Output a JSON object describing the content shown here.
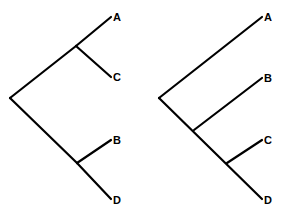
{
  "diagram": {
    "type": "cladogram-comparison",
    "line_color": "#000000",
    "background": "#ffffff",
    "trees": [
      {
        "name": "left-tree",
        "topology": "((A,C),(B,D))",
        "root": [
          10,
          98
        ],
        "branches": [
          {
            "from": [
              10,
              98
            ],
            "to": [
              76,
              46
            ]
          },
          {
            "from": [
              76,
              46
            ],
            "to": [
              111,
              17
            ]
          },
          {
            "from": [
              76,
              46
            ],
            "to": [
              111,
              77
            ]
          },
          {
            "from": [
              10,
              98
            ],
            "to": [
              77,
              163
            ]
          },
          {
            "from": [
              77,
              163
            ],
            "to": [
              111,
              140
            ]
          },
          {
            "from": [
              77,
              163
            ],
            "to": [
              111,
              199
            ]
          }
        ],
        "tips": [
          {
            "label": "A",
            "x": 113,
            "y": 21
          },
          {
            "label": "C",
            "x": 113,
            "y": 81
          },
          {
            "label": "B",
            "x": 113,
            "y": 144
          },
          {
            "label": "D",
            "x": 113,
            "y": 204
          }
        ]
      },
      {
        "name": "right-tree",
        "topology": "(A,(B,(C,D)))",
        "root": [
          159,
          98
        ],
        "branches": [
          {
            "from": [
              159,
              98
            ],
            "to": [
              262,
              17
            ]
          },
          {
            "from": [
              159,
              98
            ],
            "to": [
              262,
              199
            ]
          },
          {
            "from": [
              194,
              130
            ],
            "to": [
              262,
              78
            ]
          },
          {
            "from": [
              227,
              163
            ],
            "to": [
              262,
              140
            ]
          }
        ],
        "tips": [
          {
            "label": "A",
            "x": 264,
            "y": 21
          },
          {
            "label": "B",
            "x": 264,
            "y": 82
          },
          {
            "label": "C",
            "x": 264,
            "y": 144
          },
          {
            "label": "D",
            "x": 264,
            "y": 204
          }
        ]
      }
    ]
  }
}
